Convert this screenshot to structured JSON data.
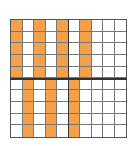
{
  "figure": {
    "type": "hundred-grid",
    "rows": 10,
    "cols": 10,
    "shade_color": "#f5a04a",
    "line_color": "#777777",
    "quadrant_line_color": "#333333",
    "shaded_regions": [
      {
        "rows": [
          1,
          2,
          3,
          4,
          5
        ],
        "cols": [
          1,
          3,
          5,
          7
        ]
      },
      {
        "rows": [
          6,
          7,
          8,
          9,
          10
        ],
        "cols": [
          2,
          4,
          6
        ]
      }
    ],
    "shaded_count": 35,
    "total_cells": 100
  }
}
